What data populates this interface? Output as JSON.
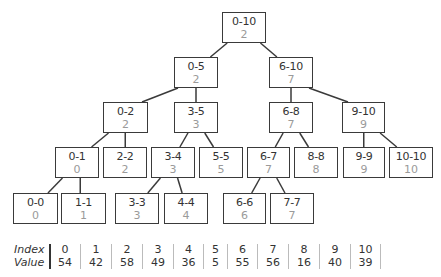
{
  "tree": {
    "nodes": [
      {
        "id": "0-10",
        "range": "0-10",
        "value": "2",
        "x": 222,
        "y": 12,
        "w": 44,
        "h": 31
      },
      {
        "id": "0-5",
        "range": "0-5",
        "value": "2",
        "x": 174,
        "y": 57,
        "w": 44,
        "h": 31
      },
      {
        "id": "6-10",
        "range": "6-10",
        "value": "7",
        "x": 269,
        "y": 57,
        "w": 44,
        "h": 31
      },
      {
        "id": "0-2",
        "range": "0-2",
        "value": "2",
        "x": 103,
        "y": 102,
        "w": 45,
        "h": 31
      },
      {
        "id": "3-5",
        "range": "3-5",
        "value": "3",
        "x": 174,
        "y": 102,
        "w": 44,
        "h": 31
      },
      {
        "id": "6-8",
        "range": "6-8",
        "value": "7",
        "x": 269,
        "y": 102,
        "w": 44,
        "h": 31
      },
      {
        "id": "9-10",
        "range": "9-10",
        "value": "9",
        "x": 342,
        "y": 102,
        "w": 43,
        "h": 31
      },
      {
        "id": "0-1",
        "range": "0-1",
        "value": "0",
        "x": 55,
        "y": 147,
        "w": 44,
        "h": 31
      },
      {
        "id": "2-2",
        "range": "2-2",
        "value": "2",
        "x": 103,
        "y": 147,
        "w": 44,
        "h": 31
      },
      {
        "id": "3-4",
        "range": "3-4",
        "value": "3",
        "x": 151,
        "y": 147,
        "w": 44,
        "h": 31
      },
      {
        "id": "5-5",
        "range": "5-5",
        "value": "5",
        "x": 199,
        "y": 147,
        "w": 44,
        "h": 31
      },
      {
        "id": "6-7",
        "range": "6-7",
        "value": "7",
        "x": 247,
        "y": 147,
        "w": 43,
        "h": 31
      },
      {
        "id": "8-8",
        "range": "8-8",
        "value": "8",
        "x": 294,
        "y": 147,
        "w": 44,
        "h": 31
      },
      {
        "id": "9-9",
        "range": "9-9",
        "value": "9",
        "x": 343,
        "y": 147,
        "w": 42,
        "h": 31
      },
      {
        "id": "10-10",
        "range": "10-10",
        "value": "10",
        "x": 389,
        "y": 147,
        "w": 44,
        "h": 31
      },
      {
        "id": "0-0",
        "range": "0-0",
        "value": "0",
        "x": 13,
        "y": 193,
        "w": 45,
        "h": 31
      },
      {
        "id": "1-1",
        "range": "1-1",
        "value": "1",
        "x": 61,
        "y": 193,
        "w": 45,
        "h": 31
      },
      {
        "id": "3-3",
        "range": "3-3",
        "value": "3",
        "x": 115,
        "y": 193,
        "w": 44,
        "h": 31
      },
      {
        "id": "4-4",
        "range": "4-4",
        "value": "4",
        "x": 164,
        "y": 193,
        "w": 44,
        "h": 31
      },
      {
        "id": "6-6",
        "range": "6-6",
        "value": "6",
        "x": 223,
        "y": 193,
        "w": 43,
        "h": 31
      },
      {
        "id": "7-7",
        "range": "7-7",
        "value": "7",
        "x": 270,
        "y": 193,
        "w": 44,
        "h": 31
      }
    ],
    "edges": [
      [
        "0-10",
        "0-5"
      ],
      [
        "0-10",
        "6-10"
      ],
      [
        "0-5",
        "0-2"
      ],
      [
        "0-5",
        "3-5"
      ],
      [
        "6-10",
        "6-8"
      ],
      [
        "6-10",
        "9-10"
      ],
      [
        "0-2",
        "0-1"
      ],
      [
        "0-2",
        "2-2"
      ],
      [
        "3-5",
        "3-4"
      ],
      [
        "3-5",
        "5-5"
      ],
      [
        "6-8",
        "6-7"
      ],
      [
        "6-8",
        "8-8"
      ],
      [
        "9-10",
        "9-9"
      ],
      [
        "9-10",
        "10-10"
      ],
      [
        "0-1",
        "0-0"
      ],
      [
        "0-1",
        "1-1"
      ],
      [
        "3-4",
        "3-3"
      ],
      [
        "3-4",
        "4-4"
      ],
      [
        "6-7",
        "6-6"
      ],
      [
        "6-7",
        "7-7"
      ]
    ]
  },
  "table": {
    "index_label": "Index",
    "value_label": "Value",
    "columns": [
      {
        "index": "0",
        "value": "54"
      },
      {
        "index": "1",
        "value": "42"
      },
      {
        "index": "2",
        "value": "58"
      },
      {
        "index": "3",
        "value": "49"
      },
      {
        "index": "4",
        "value": "36"
      },
      {
        "index": "5",
        "value": "5"
      },
      {
        "index": "6",
        "value": "55"
      },
      {
        "index": "7",
        "value": "56"
      },
      {
        "index": "8",
        "value": "16"
      },
      {
        "index": "9",
        "value": "40"
      },
      {
        "index": "10",
        "value": "39"
      }
    ],
    "separators": [
      49,
      80,
      111,
      142,
      173,
      203,
      227,
      257,
      288,
      319,
      350,
      380
    ]
  },
  "colors": {
    "border": "#3a3a3a",
    "label_text": "#333333",
    "value_text": "#9a9a9a"
  }
}
